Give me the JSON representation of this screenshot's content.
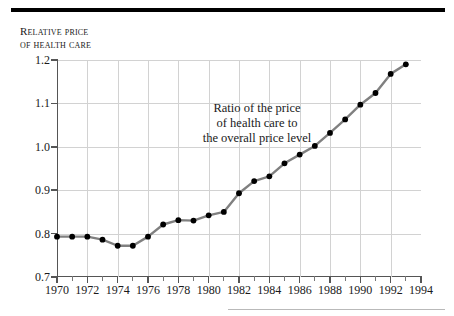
{
  "figure": {
    "axis_title_lines": [
      "Relative price",
      "of health care"
    ],
    "annotation_lines": [
      "Ratio of the price",
      "of health care to",
      "the overall price level"
    ],
    "line_color": "#808080",
    "marker_color": "#000000",
    "grid_color": "#d2d2d2",
    "axis_color": "#555555",
    "rule_color": "#000000"
  },
  "chart_data": {
    "type": "line",
    "title": "Relative price of health care",
    "xlabel": "",
    "ylabel": "Relative price of health care",
    "xlim": [
      1970,
      1994
    ],
    "ylim": [
      0.7,
      1.2
    ],
    "grid": true,
    "legend": "none",
    "annotations": [
      "Ratio of the price of health care to the overall price level"
    ],
    "ytick_labels": [
      "0.7",
      "0.8",
      "0.9",
      "1.0",
      "1.1",
      "1.2"
    ],
    "ytick_values": [
      0.7,
      0.8,
      0.9,
      1.0,
      1.1,
      1.2
    ],
    "xtick_labels": [
      "1970",
      "1972",
      "1974",
      "1976",
      "1978",
      "1980",
      "1982",
      "1984",
      "1986",
      "1988",
      "1990",
      "1992",
      "1994"
    ],
    "xtick_values": [
      1970,
      1972,
      1974,
      1976,
      1978,
      1980,
      1982,
      1984,
      1986,
      1988,
      1990,
      1992,
      1994
    ],
    "xtick_minor_values": [
      1971,
      1973,
      1975,
      1977,
      1979,
      1981,
      1983,
      1985,
      1987,
      1989,
      1991,
      1993
    ],
    "series": [
      {
        "name": "Ratio of the price of health care to the overall price level",
        "x": [
          1970,
          1971,
          1972,
          1973,
          1974,
          1975,
          1976,
          1977,
          1978,
          1979,
          1980,
          1981,
          1982,
          1983,
          1984,
          1985,
          1986,
          1987,
          1988,
          1989,
          1990,
          1991,
          1992,
          1993
        ],
        "values": [
          0.793,
          0.793,
          0.793,
          0.786,
          0.772,
          0.772,
          0.793,
          0.821,
          0.831,
          0.83,
          0.842,
          0.85,
          0.893,
          0.921,
          0.932,
          0.962,
          0.982,
          1.002,
          1.032,
          1.063,
          1.097,
          1.124,
          1.168,
          1.19
        ]
      }
    ]
  }
}
